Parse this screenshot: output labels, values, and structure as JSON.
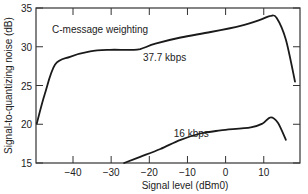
{
  "chart_data": {
    "type": "line",
    "title": "",
    "annotation": "C-message weighting",
    "xlabel": "Signal level (dBm0)",
    "ylabel": "Signal-to-quantizing noise (dB)",
    "xlim": [
      -49.7,
      19.5
    ],
    "ylim": [
      15,
      35
    ],
    "xticks": [
      -40,
      -30,
      -20,
      -10,
      0,
      10
    ],
    "xtick_labels": [
      "−40",
      "−30",
      "−20",
      "−10",
      "0",
      "10"
    ],
    "yticks": [
      15,
      20,
      25,
      30,
      35
    ],
    "ytick_labels": [
      "15",
      "20",
      "25",
      "30",
      "35"
    ],
    "grid": false,
    "legend": "inline labels",
    "series": [
      {
        "name": "37.7 kbps",
        "label_pos": [
          -16,
          28.2
        ],
        "x": [
          -49.5,
          -47.4,
          -44.7,
          -40.8,
          -35.5,
          -30.3,
          -25.0,
          -22.4,
          -18.4,
          -11.8,
          -3.9,
          3.9,
          9.2,
          11.8,
          13.4,
          15.8,
          18.2
        ],
        "y": [
          20.1,
          23.9,
          27.7,
          28.7,
          29.4,
          29.6,
          29.6,
          29.7,
          30.4,
          31.2,
          31.9,
          32.7,
          33.5,
          34.0,
          33.7,
          30.9,
          25.5
        ]
      },
      {
        "name": "16 kbps",
        "label_pos": [
          -9,
          18.4
        ],
        "x": [
          -26.6,
          -22.4,
          -17.1,
          -11.8,
          -6.6,
          -1.3,
          6.6,
          9.7,
          11.8,
          13.7,
          15.8
        ],
        "y": [
          15.0,
          15.8,
          16.8,
          18.0,
          18.8,
          19.2,
          19.6,
          20.1,
          20.9,
          20.2,
          18.0
        ]
      }
    ]
  },
  "colors": {
    "line": "#1a1a1a",
    "axis": "#333333",
    "text": "#222222",
    "background": "#ffffff"
  }
}
